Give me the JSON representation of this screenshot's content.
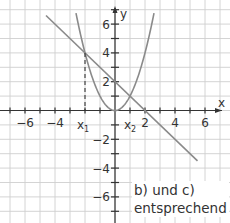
{
  "chart_data": {
    "type": "line",
    "title": "",
    "xlabel": "x",
    "ylabel": "y",
    "xlim": [
      -7.6,
      7.6
    ],
    "ylim": [
      -7.8,
      7.6
    ],
    "grid": true,
    "x_tick_labels": [
      "-6",
      "-4",
      "2",
      "4",
      "6"
    ],
    "y_tick_labels": [
      "6",
      "4",
      "2",
      "-2",
      "-4",
      "-6"
    ],
    "series": [
      {
        "name": "parabola",
        "formula": "y = x^2",
        "x_range": [
          -2.6,
          2.6
        ],
        "color": "#8a8a8a"
      },
      {
        "name": "line",
        "formula": "y = -x + 2",
        "x_range": [
          -4.6,
          5.5
        ],
        "color": "#8a8a8a"
      }
    ],
    "annotations": [
      {
        "text": "x1",
        "x": -2,
        "note": "dashed vertical line from intersection (-2, 4) to x-axis"
      },
      {
        "text": "x2",
        "x": 1,
        "note": "intersection at (1, 1)"
      }
    ],
    "intersections": [
      [
        -2,
        4
      ],
      [
        1,
        1
      ]
    ]
  },
  "axes": {
    "x_label": "x",
    "y_label": "y",
    "x_ticks": [
      {
        "value": -6,
        "label": "−6"
      },
      {
        "value": -4,
        "label": "−4"
      },
      {
        "value": 2,
        "label": "2"
      },
      {
        "value": 4,
        "label": "4"
      },
      {
        "value": 6,
        "label": "6"
      }
    ],
    "y_ticks": [
      {
        "value": 6,
        "label": "6"
      },
      {
        "value": 4,
        "label": "4"
      },
      {
        "value": 2,
        "label": "2"
      },
      {
        "value": -2,
        "label": "−2"
      },
      {
        "value": -4,
        "label": "−4"
      },
      {
        "value": -6,
        "label": "−6"
      }
    ],
    "x1_label": "x",
    "x1_sub": "1",
    "x2_label": "x",
    "x2_sub": "2"
  },
  "note": {
    "line1": "b) und c)",
    "line2": "entsprechend"
  },
  "colors": {
    "grid": "#c8c8c8",
    "axis": "#333333",
    "curve": "#8a8a8a"
  }
}
